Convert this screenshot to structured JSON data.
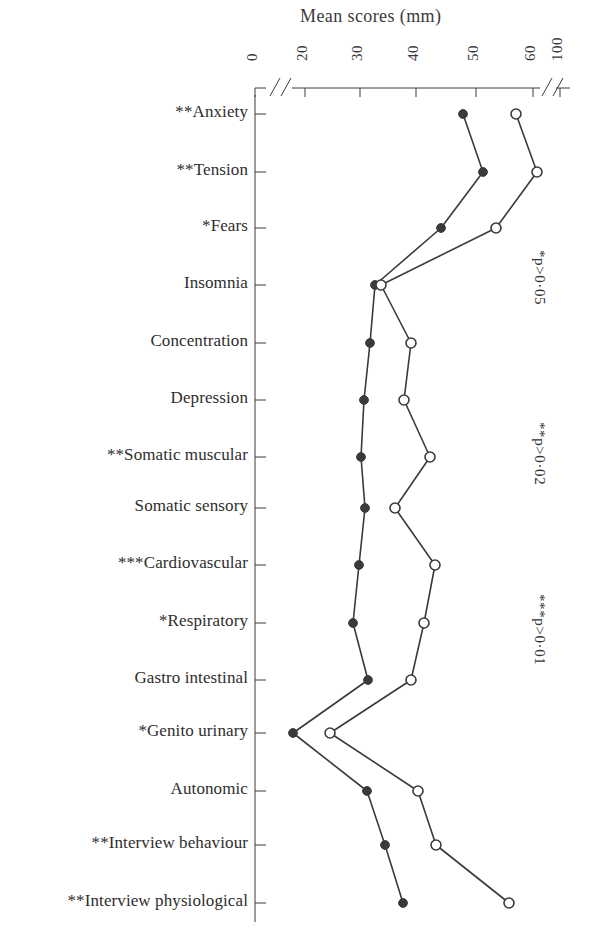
{
  "figure": {
    "axis_title": "Mean scores (mm)",
    "axis_ticks": [
      {
        "label": "0",
        "value": 0,
        "x": 255
      },
      {
        "label": "20",
        "value": 20,
        "x": 305
      },
      {
        "label": "30",
        "value": 30,
        "x": 360
      },
      {
        "label": "40",
        "value": 40,
        "x": 416
      },
      {
        "label": "50",
        "value": 50,
        "x": 476
      },
      {
        "label": "60",
        "value": 60,
        "x": 533
      },
      {
        "label": "100",
        "value": 100,
        "x": 560
      }
    ],
    "significance_notes": [
      {
        "text": "*p>0·05",
        "x": 548,
        "y": 250
      },
      {
        "text": "**p>0·02",
        "x": 548,
        "y": 422
      },
      {
        "text": "***p>0·01",
        "x": 548,
        "y": 594
      }
    ],
    "marker_colors": {
      "filled": "#3a3a3a",
      "open_stroke": "#3a3a3a",
      "open_fill": "#ffffff",
      "line": "#3a3a3a"
    }
  },
  "chart_data": {
    "type": "line",
    "title": "Mean scores (mm)",
    "xlabel": "Mean scores (mm)",
    "ylabel": "",
    "orientation": "horizontal",
    "xlim": [
      0,
      100
    ],
    "xticks": [
      0,
      20,
      30,
      40,
      50,
      60,
      100
    ],
    "axis_break": true,
    "grid": false,
    "legend_position": "none",
    "categories": [
      "**Anxiety",
      "**Tension",
      "*Fears",
      "Insomnia",
      "Concentration",
      "Depression",
      "**Somatic muscular",
      "Somatic sensory",
      "***Cardiovascular",
      "*Respiratory",
      "Gastro intestinal",
      "*Genito urinary",
      "Autonomic",
      "**Interview behaviour",
      "**Interview physiological"
    ],
    "significance_stars": [
      "**",
      "**",
      "*",
      "",
      "",
      "",
      "**",
      "",
      "***",
      "*",
      "",
      "*",
      "",
      "**",
      "**"
    ],
    "series": [
      {
        "name": "filled-circle-series",
        "marker": "filled-circle",
        "values": [
          48.5,
          52.1,
          44.8,
          36.0,
          35.1,
          34.0,
          33.3,
          32.0,
          31.1,
          30.2,
          32.5,
          26.7,
          32.6,
          36.5,
          40.8
        ]
      },
      {
        "name": "open-circle-series",
        "marker": "open-circle",
        "values": [
          57.5,
          60.0,
          50.0,
          36.8,
          41.4,
          40.3,
          46.0,
          33.2,
          47.2,
          44.3,
          41.0,
          30.0,
          42.5,
          46.8,
          57.0
        ]
      }
    ],
    "row_pixel_y": [
      114,
      172,
      228,
      285,
      343,
      400,
      457,
      508,
      565,
      623,
      680,
      733,
      791,
      845,
      903
    ],
    "series_pixel_x": {
      "filled": [
        463,
        483,
        441,
        375,
        370,
        364,
        361,
        365,
        359,
        353,
        368,
        293,
        367,
        385,
        403
      ],
      "open": [
        516,
        537,
        496,
        381,
        411,
        404,
        430,
        395,
        435,
        424,
        411,
        330,
        418,
        436,
        509
      ]
    }
  }
}
